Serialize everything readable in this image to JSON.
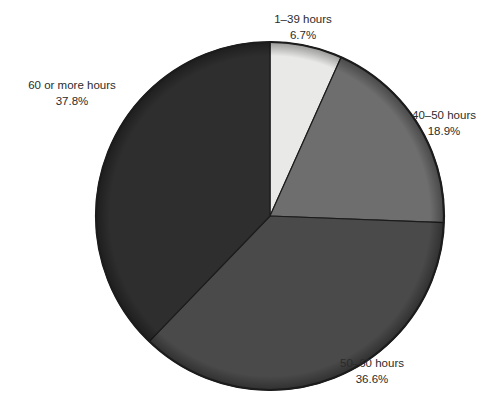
{
  "chart_data": {
    "type": "pie",
    "title": "",
    "categories": [
      "1–39 hours",
      "40–50 hours",
      "50–60 hours",
      "60 or more hours"
    ],
    "values": [
      6.7,
      18.9,
      36.6,
      37.8
    ],
    "value_suffix": "%",
    "start_angle_deg": 0,
    "direction": "clockwise",
    "legend": "none",
    "labels_position": "outside",
    "colors": [
      "#e9e9e7",
      "#6e6e6e",
      "#4a4a4a",
      "#2e2e2e"
    ],
    "outline_color": "#1c1c1c",
    "background": "#ffffff",
    "slices": [
      {
        "label": "1–39 hours",
        "percent_text": "6.7%",
        "value": 6.7,
        "color": "#e9e9e7"
      },
      {
        "label": "40–50 hours",
        "percent_text": "18.9%",
        "value": 18.9,
        "color": "#6e6e6e"
      },
      {
        "label": "50–60 hours",
        "percent_text": "36.6%",
        "value": 36.6,
        "color": "#4a4a4a"
      },
      {
        "label": "60 or more hours",
        "percent_text": "37.8%",
        "value": 37.8,
        "color": "#2e2e2e"
      }
    ]
  },
  "labels": {
    "top": {
      "category": "1–39 hours",
      "percent": "6.7%"
    },
    "right": {
      "category": "40–50 hours",
      "percent": "18.9%"
    },
    "bottom_right": {
      "category": "50–60 hours",
      "percent": "36.6%"
    },
    "left": {
      "category": "60 or more hours",
      "percent": "37.8%"
    }
  }
}
